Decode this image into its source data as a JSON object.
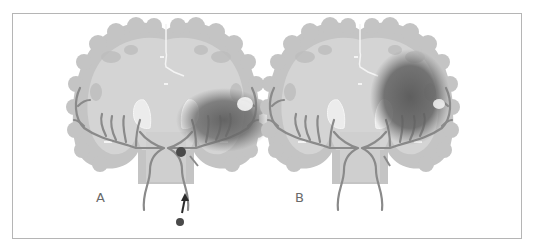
{
  "figure": {
    "panels": [
      {
        "id": "A",
        "label": "A",
        "description": "Coronal brain section with lesion in right hemisphere territory; embolus in carotid artery with arrow indicating travel from below"
      },
      {
        "id": "B",
        "label": "B",
        "description": "Coronal brain section with larger lesion in right hemisphere territory"
      }
    ]
  },
  "colors": {
    "cortex": "#c4c4c4",
    "white_matter": "#d6d6d6",
    "vessel": "#8a8a8a",
    "lesion": "#6e6e6e",
    "deep_nuclei": "#ececec",
    "embolus": "#4a4a4a",
    "border": "#b5b5b5",
    "label": "#6a6a6a"
  }
}
